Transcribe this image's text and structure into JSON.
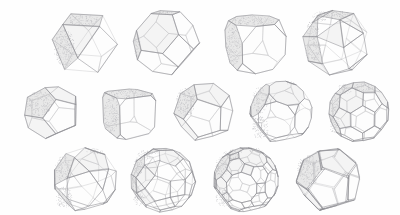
{
  "figure": {
    "background_color": "#ffffff",
    "line_color": "#8e8e92",
    "shade_color": "#e8e8e8",
    "style": "hand-drawn pencil line art with stippled shading",
    "row_counts": [
      4,
      5,
      4
    ],
    "total_count": 13
  },
  "solids": [
    {
      "name": "cuboctahedron",
      "row": 1,
      "col": 1,
      "x": 42,
      "y": 4,
      "w": 84,
      "h": 72,
      "cx": 42,
      "cy": 38,
      "r": 33,
      "faces": "squares and triangles",
      "shading": "lower-left"
    },
    {
      "name": "truncated-octahedron",
      "row": 1,
      "col": 2,
      "x": 126,
      "y": 4,
      "w": 80,
      "h": 72,
      "cx": 40,
      "cy": 38,
      "r": 33,
      "faces": "hexagons and squares",
      "shading": "lower-left"
    },
    {
      "name": "truncated-cube",
      "row": 1,
      "col": 3,
      "x": 214,
      "y": 4,
      "w": 80,
      "h": 72,
      "cx": 40,
      "cy": 38,
      "r": 33,
      "faces": "octagons and triangles",
      "shading": "lower-left"
    },
    {
      "name": "snub-cube",
      "row": 1,
      "col": 4,
      "x": 294,
      "y": 4,
      "w": 84,
      "h": 72,
      "cx": 42,
      "cy": 38,
      "r": 33,
      "faces": "squares and triangles",
      "shading": "lower-left"
    },
    {
      "name": "trapezohedral-solid",
      "row": 2,
      "col": 1,
      "x": 14,
      "y": 78,
      "w": 76,
      "h": 68,
      "cx": 38,
      "cy": 34,
      "r": 30,
      "faces": "pentagons and quadrilaterals",
      "shading": "left"
    },
    {
      "name": "truncated-hexahedron-rounded",
      "row": 2,
      "col": 2,
      "x": 90,
      "y": 78,
      "w": 76,
      "h": 68,
      "cx": 38,
      "cy": 34,
      "r": 30,
      "faces": "large quadrilaterals with corner triangles",
      "shading": "lower-left"
    },
    {
      "name": "dodecahedron",
      "row": 2,
      "col": 3,
      "x": 166,
      "y": 78,
      "w": 76,
      "h": 68,
      "cx": 38,
      "cy": 34,
      "r": 30,
      "faces": "pentagons",
      "shading": "lower-left"
    },
    {
      "name": "truncated-dodecahedron",
      "row": 2,
      "col": 4,
      "x": 242,
      "y": 78,
      "w": 78,
      "h": 68,
      "cx": 39,
      "cy": 34,
      "r": 31,
      "faces": "decagons and triangles",
      "shading": "lower-left"
    },
    {
      "name": "truncated-icosahedron",
      "row": 2,
      "col": 5,
      "x": 320,
      "y": 78,
      "w": 78,
      "h": 68,
      "cx": 39,
      "cy": 34,
      "r": 30,
      "faces": "hexagons and pentagons",
      "shading": "lower-left"
    },
    {
      "name": "icosidodecahedron",
      "row": 3,
      "col": 1,
      "x": 46,
      "y": 146,
      "w": 78,
      "h": 68,
      "cx": 39,
      "cy": 34,
      "r": 32,
      "faces": "triangles and pentagons",
      "shading": "lower-left"
    },
    {
      "name": "rhombicosidodecahedron",
      "row": 3,
      "col": 2,
      "x": 124,
      "y": 146,
      "w": 78,
      "h": 68,
      "cx": 39,
      "cy": 34,
      "r": 32,
      "faces": "squares, triangles and pentagons",
      "shading": "lower-left"
    },
    {
      "name": "truncated-icosidodecahedron",
      "row": 3,
      "col": 3,
      "x": 206,
      "y": 146,
      "w": 80,
      "h": 68,
      "cx": 40,
      "cy": 34,
      "r": 32,
      "faces": "decagons, hexagons and squares",
      "shading": "lower-left"
    },
    {
      "name": "snub-dodecahedron",
      "row": 3,
      "col": 4,
      "x": 288,
      "y": 146,
      "w": 82,
      "h": 68,
      "cx": 41,
      "cy": 34,
      "r": 32,
      "faces": "triangles and pentagons",
      "shading": "lower-left"
    }
  ]
}
